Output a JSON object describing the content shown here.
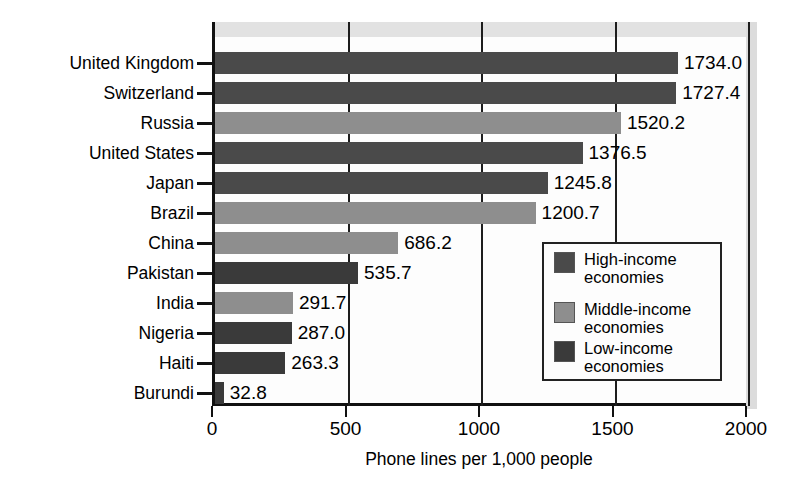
{
  "chart_data": {
    "type": "bar",
    "orientation": "horizontal",
    "title": "",
    "xlabel": "Phone lines per 1,000 people",
    "ylabel": "",
    "xlim": [
      0,
      2000
    ],
    "xticks": [
      0,
      500,
      1000,
      1500,
      2000
    ],
    "xtick_labels": [
      "0",
      "500",
      "1000",
      "1500",
      "2000"
    ],
    "grid": true,
    "legend_position": "inside-lower-right",
    "categories": [
      "United Kingdom",
      "Switzerland",
      "Russia",
      "United States",
      "Japan",
      "Brazil",
      "China",
      "Pakistan",
      "India",
      "Nigeria",
      "Haiti",
      "Burundi"
    ],
    "values": [
      1734.0,
      1727.4,
      1520.2,
      1376.5,
      1245.8,
      1200.7,
      686.2,
      535.7,
      291.7,
      287.0,
      263.3,
      32.8
    ],
    "value_labels": [
      "1734.0",
      "1727.4",
      "1520.2",
      "1376.5",
      "1245.8",
      "1200.7",
      "686.2",
      "535.7",
      "291.7",
      "287.0",
      "263.3",
      "32.8"
    ],
    "groups": [
      "high",
      "high",
      "middle",
      "high",
      "high",
      "middle",
      "middle",
      "low",
      "middle",
      "low",
      "low",
      "low"
    ],
    "series": [
      {
        "name": "High-income economies",
        "key": "high",
        "color": "#4a4a4a",
        "points": [
          {
            "category": "United Kingdom",
            "value": 1734.0
          },
          {
            "category": "Switzerland",
            "value": 1727.4
          },
          {
            "category": "United States",
            "value": 1376.5
          },
          {
            "category": "Japan",
            "value": 1245.8
          }
        ]
      },
      {
        "name": "Middle-income economies",
        "key": "middle",
        "color": "#8e8e8e",
        "points": [
          {
            "category": "Russia",
            "value": 1520.2
          },
          {
            "category": "Brazil",
            "value": 1200.7
          },
          {
            "category": "China",
            "value": 686.2
          },
          {
            "category": "India",
            "value": 291.7
          }
        ]
      },
      {
        "name": "Low-income economies",
        "key": "low",
        "color": "#3a3a3a",
        "points": [
          {
            "category": "Pakistan",
            "value": 535.7
          },
          {
            "category": "Nigeria",
            "value": 287.0
          },
          {
            "category": "Haiti",
            "value": 263.3
          },
          {
            "category": "Burundi",
            "value": 32.8
          }
        ]
      }
    ]
  },
  "legend": {
    "items": [
      {
        "line1": "High-income",
        "line2": "economies",
        "key": "high"
      },
      {
        "line1": "Middle-income",
        "line2": "economies",
        "key": "middle"
      },
      {
        "line1": "Low-income",
        "line2": "economies",
        "key": "low"
      }
    ]
  },
  "axis": {
    "x_title": "Phone lines per 1,000 people",
    "ticks": [
      "0",
      "500",
      "1000",
      "1500",
      "2000"
    ]
  }
}
